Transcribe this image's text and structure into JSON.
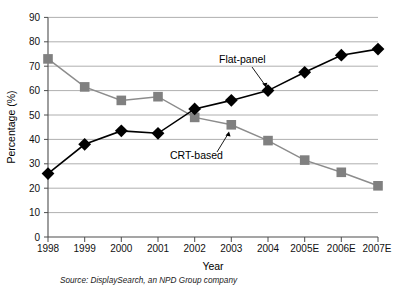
{
  "chart_data": {
    "type": "line",
    "title": "",
    "xlabel": "Year",
    "ylabel": "Percentage (%)",
    "categories": [
      "1998",
      "1999",
      "2000",
      "2001",
      "2002",
      "2003",
      "2004",
      "2005E",
      "2006E",
      "2007E"
    ],
    "ylim": [
      0,
      90
    ],
    "ytick_step": 10,
    "yticks": [
      "0",
      "10",
      "20",
      "30",
      "40",
      "50",
      "60",
      "70",
      "80",
      "90"
    ],
    "grid": "horizontal",
    "legend": "inline-annotations",
    "series": [
      {
        "name": "Flat-panel",
        "marker": "diamond",
        "color": "#000000",
        "values": [
          26,
          38,
          43.5,
          42.5,
          52.5,
          56,
          60,
          67.5,
          74.5,
          77
        ]
      },
      {
        "name": "CRT-based",
        "marker": "square",
        "color": "#808080",
        "values": [
          73,
          61.5,
          56,
          57.5,
          49,
          46,
          39.5,
          31.5,
          26.5,
          21
        ]
      }
    ],
    "annotations": [
      {
        "text": "Flat-panel",
        "series": "Flat-panel"
      },
      {
        "text": "CRT-based",
        "series": "CRT-based"
      }
    ],
    "source": "Source: DisplaySearch, an NPD Group company"
  },
  "axis": {
    "y_title": "Percentage (%)",
    "x_title": "Year"
  },
  "yticks": {
    "t0": "0",
    "t1": "10",
    "t2": "20",
    "t3": "30",
    "t4": "40",
    "t5": "50",
    "t6": "60",
    "t7": "70",
    "t8": "80",
    "t9": "90"
  },
  "xticks": {
    "t0": "1998",
    "t1": "1999",
    "t2": "2000",
    "t3": "2001",
    "t4": "2002",
    "t5": "2003",
    "t6": "2004",
    "t7": "2005E",
    "t8": "2006E",
    "t9": "2007E"
  },
  "labels": {
    "flat_panel": "Flat-panel",
    "crt_based": "CRT-based"
  },
  "footer": {
    "source": "Source: DisplaySearch, an NPD Group company"
  }
}
